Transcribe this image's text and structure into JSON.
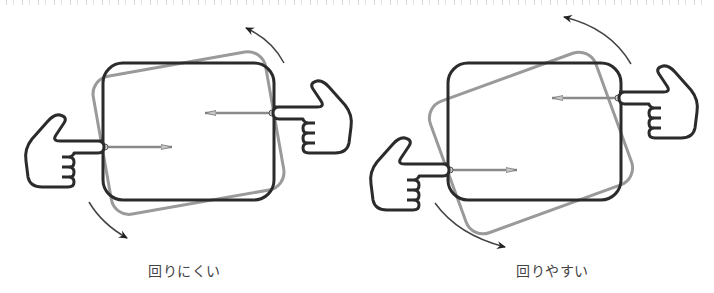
{
  "header": {
    "clipped_text_visible": false
  },
  "figures": [
    {
      "id": "left",
      "caption": "回りにくい",
      "box_black": {
        "x": 103,
        "y": 63,
        "w": 171,
        "h": 137
      },
      "box_gray_rotation_deg": -10,
      "force_offset": "small"
    },
    {
      "id": "right",
      "caption": "回りやすい",
      "box_black": {
        "x": 448,
        "y": 63,
        "w": 173,
        "h": 137
      },
      "box_gray_rotation_deg": -20,
      "force_offset": "large"
    }
  ],
  "colors": {
    "outline": "#2b2b2b",
    "rotated_box": "#9a9a9a",
    "force_arrow": "#8a8a8a",
    "caption": "#444444"
  }
}
